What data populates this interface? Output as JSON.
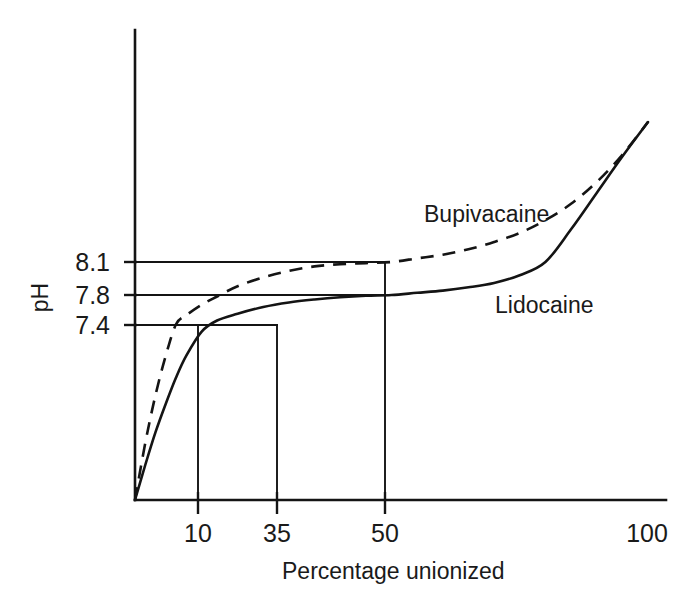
{
  "figure": {
    "background_color": "#ffffff",
    "ink_color": "#141414",
    "width": 685,
    "height": 607
  },
  "chart_data": {
    "type": "line",
    "title": "",
    "subtitle": "",
    "xlabel": "Percentage unionized",
    "ylabel": "pH",
    "grid": false,
    "legend_position": "inline-annotation",
    "xlim": [
      0,
      100
    ],
    "ylim": [
      6.6,
      8.9
    ],
    "xticks": [
      10,
      35,
      50,
      100
    ],
    "xtick_labels": [
      "10",
      "35",
      "50",
      "100"
    ],
    "yticks": [
      7.4,
      7.8,
      8.1
    ],
    "ytick_labels": [
      "7.4",
      "7.8",
      "8.1"
    ],
    "annotations": [
      {
        "text": "Bupivacaine",
        "series": "Bupivacaine",
        "x": 37,
        "y": 8.35
      },
      {
        "text": "Lidocaine",
        "series": "Lidocaine",
        "x": 68,
        "y": 7.72
      }
    ],
    "construction_lines": [
      {
        "type": "horizontal",
        "y": 8.1,
        "from_x": 0,
        "to_x": 50,
        "meaning": "Bupivacaine reaches 50% unionized at pH 8.1"
      },
      {
        "type": "horizontal",
        "y": 7.8,
        "from_x": 0,
        "to_x": 50,
        "meaning": "Lidocaine reaches 50% unionized at pH 7.8"
      },
      {
        "type": "horizontal",
        "y": 7.4,
        "from_x": 0,
        "to_x": 35,
        "meaning": "Lidocaine reaches 35% unionized at pH 7.4"
      },
      {
        "type": "vertical",
        "x": 10,
        "from_y": 6.6,
        "to_y": 7.4
      },
      {
        "type": "vertical",
        "x": 35,
        "from_y": 6.6,
        "to_y": 7.4
      },
      {
        "type": "vertical",
        "x": 50,
        "from_y": 6.6,
        "to_y": 8.1
      }
    ],
    "series": [
      {
        "name": "Bupivacaine",
        "style": "dashed",
        "x": [
          0,
          2,
          4,
          6,
          8,
          10,
          13,
          16,
          20,
          25,
          30,
          35,
          40,
          45,
          50,
          55,
          60,
          65,
          70,
          75,
          80,
          85,
          90,
          95,
          100
        ],
        "y": [
          6.6,
          6.86,
          7.08,
          7.26,
          7.41,
          7.53,
          7.67,
          7.78,
          7.88,
          7.96,
          8.02,
          8.06,
          8.08,
          8.09,
          8.1,
          8.12,
          8.14,
          8.17,
          8.21,
          8.26,
          8.33,
          8.42,
          8.54,
          8.69,
          8.87
        ]
      },
      {
        "name": "Lidocaine",
        "style": "solid",
        "x": [
          0,
          2,
          4,
          6,
          8,
          10,
          13,
          16,
          20,
          25,
          30,
          35,
          40,
          45,
          50,
          55,
          60,
          65,
          70,
          75,
          80,
          85,
          90,
          95,
          100
        ],
        "y": [
          6.6,
          6.76,
          6.91,
          7.04,
          7.16,
          7.26,
          7.37,
          7.46,
          7.55,
          7.64,
          7.7,
          7.74,
          7.77,
          7.79,
          7.8,
          7.82,
          7.84,
          7.87,
          7.91,
          7.98,
          8.1,
          8.28,
          8.48,
          8.68,
          8.87
        ]
      }
    ]
  },
  "axis": {
    "y_tick_labels": [
      "8.1",
      "7.8",
      "7.4"
    ],
    "x_tick_labels": [
      "10",
      "35",
      "50",
      "100"
    ],
    "y_axis_title": "pH",
    "x_axis_title": "Percentage unionized"
  },
  "labels": {
    "bupivacaine": "Bupivacaine",
    "lidocaine": "Lidocaine"
  }
}
